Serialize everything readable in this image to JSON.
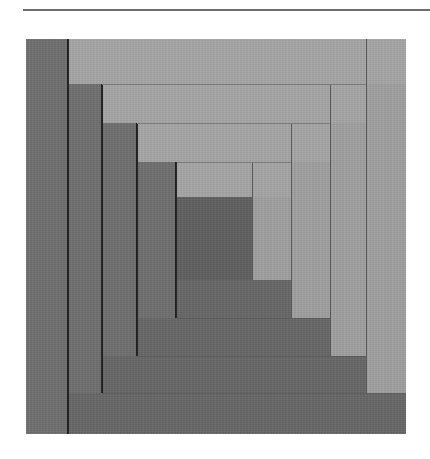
{
  "image": {
    "subject": "Log cabin quilt block",
    "description": "Square quilt block built from concentric L-shaped fabric strips; dark strips along the left and bottom, light strips along the top and right, dark square in the centre",
    "colors": {
      "background": "#ffffff",
      "rule": "#6d6d6d",
      "dark_fabric": "#6f6f6f",
      "light_fabric": "#a6a6a6",
      "center_square": "#606060",
      "seam_dark": "#1e1e1e"
    },
    "rounds": 4
  }
}
